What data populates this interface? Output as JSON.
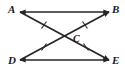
{
  "figure": {
    "type": "geometry-diagram",
    "width": 125,
    "height": 71,
    "background_color": "#ffffff",
    "stroke_color": "#262626",
    "label_color": "#1a1a1a",
    "vertices": [
      {
        "id": "A",
        "label": "A",
        "x": 20,
        "y": 12,
        "label_x": 8,
        "label_y": 4
      },
      {
        "id": "B",
        "label": "B",
        "x": 109,
        "y": 12,
        "label_x": 112,
        "label_y": 4
      },
      {
        "id": "C",
        "label": "C",
        "x": 67,
        "y": 33,
        "label_x": 73,
        "label_y": 33
      },
      {
        "id": "D",
        "label": "D",
        "x": 20,
        "y": 60,
        "label_x": 8,
        "label_y": 55
      },
      {
        "id": "E",
        "label": "E",
        "x": 109,
        "y": 60,
        "label_x": 112,
        "label_y": 55
      }
    ],
    "segments": [
      {
        "name": "AB",
        "from": "A",
        "to": "B",
        "x1": 20,
        "y1": 12,
        "x2": 109,
        "y2": 12,
        "arrow_start": true,
        "arrow_end": true,
        "width": 1.7
      },
      {
        "name": "DE",
        "from": "D",
        "to": "E",
        "x1": 20,
        "y1": 60,
        "x2": 109,
        "y2": 60,
        "arrow_start": true,
        "arrow_end": true,
        "width": 1.7
      },
      {
        "name": "AE",
        "from": "A",
        "to": "E",
        "x1": 20,
        "y1": 12,
        "x2": 109,
        "y2": 60,
        "arrow_start": false,
        "arrow_end": true,
        "width": 1.7
      },
      {
        "name": "DB",
        "from": "D",
        "to": "B",
        "x1": 20,
        "y1": 60,
        "x2": 109,
        "y2": 12,
        "arrow_start": false,
        "arrow_end": true,
        "width": 1.7
      }
    ],
    "tick_marks": [
      {
        "name": "tick-AC",
        "on_segment": "AE",
        "x": 44,
        "y": 25,
        "count": 1
      },
      {
        "name": "tick-BC",
        "on_segment": "DB",
        "x": 85,
        "y": 25,
        "count": 1
      },
      {
        "name": "tick-DC",
        "on_segment": "DB",
        "x": 44,
        "y": 47,
        "count": 1
      },
      {
        "name": "tick-CE",
        "on_segment": "AE",
        "x": 86,
        "y": 47,
        "count": 1
      }
    ]
  }
}
